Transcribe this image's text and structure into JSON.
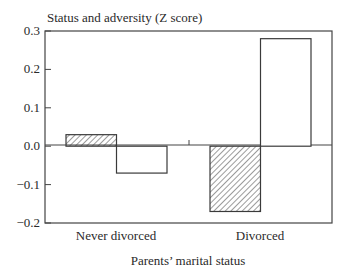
{
  "chart_data": {
    "type": "bar",
    "title": "",
    "ylabel": "Status and adversity (Z score)",
    "xlabel": "Parents’ marital status",
    "categories": [
      "Never divorced",
      "Divorced"
    ],
    "series": [
      {
        "name": "Series 1 (hatched)",
        "pattern": "hatched",
        "values": [
          0.03,
          -0.17
        ]
      },
      {
        "name": "Series 2 (open)",
        "pattern": "open",
        "values": [
          -0.07,
          0.28
        ]
      }
    ],
    "ylim": [
      -0.2,
      0.3
    ],
    "yticks": [
      0.3,
      0.2,
      0.1,
      0.0,
      -0.1,
      -0.2
    ],
    "ytick_labels": [
      "0.3",
      "0.2",
      "0.1",
      "0.0",
      "−0.1",
      "−0.2"
    ],
    "grid": false,
    "legend": null,
    "colors": {
      "stroke": "#3a3a3a",
      "fill_open": "#ffffff",
      "hatch": "#3a3a3a"
    }
  }
}
